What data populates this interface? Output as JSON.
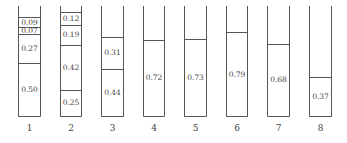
{
  "diagram": {
    "type": "stacked-tubes",
    "scale": {
      "bottom_y": 116,
      "top_y": 6,
      "px_per_unit": 106
    },
    "columns": [
      {
        "label": "1",
        "x": 18,
        "width": 22,
        "segments": [
          0.5,
          0.27,
          0.07,
          0.09
        ]
      },
      {
        "label": "2",
        "x": 60,
        "width": 21,
        "segments": [
          0.25,
          0.42,
          0.19,
          0.12
        ]
      },
      {
        "label": "3",
        "x": 101,
        "width": 22,
        "segments": [
          0.44,
          0.31
        ]
      },
      {
        "label": "4",
        "x": 143,
        "width": 21,
        "segments": [
          0.72
        ]
      },
      {
        "label": "5",
        "x": 184,
        "width": 22,
        "segments": [
          0.73
        ]
      },
      {
        "label": "6",
        "x": 226,
        "width": 21,
        "segments": [
          0.79
        ]
      },
      {
        "label": "7",
        "x": 267,
        "width": 22,
        "segments": [
          0.68
        ]
      },
      {
        "label": "8",
        "x": 309,
        "width": 22,
        "segments": [
          0.37
        ]
      }
    ]
  }
}
